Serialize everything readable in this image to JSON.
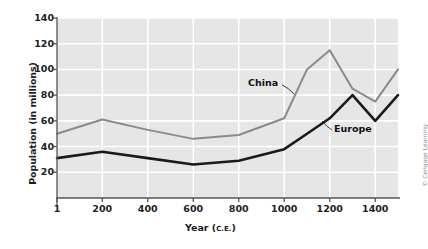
{
  "figure": {
    "credit": "© Cengage Learning"
  },
  "chart_data": {
    "type": "line",
    "title": "",
    "xlabel": "Year (C.E.)",
    "xlabel_main": "Year (",
    "xlabel_small": "C.E.",
    "xlabel_end": ")",
    "ylabel": "Population (in millions)",
    "xlim": [
      1,
      1500
    ],
    "ylim": [
      0,
      140
    ],
    "yticks": [
      140,
      120,
      100,
      80,
      60,
      40,
      20
    ],
    "xticks": [
      1,
      200,
      400,
      600,
      800,
      1000,
      1200,
      1400
    ],
    "xticklabels": [
      "1",
      "200",
      "400",
      "600",
      "800",
      "1000",
      "1200",
      "1400"
    ],
    "grid": true,
    "legend": "inline-labels",
    "colors": {
      "china": "#8a8a8a",
      "europe": "#1a1a1a",
      "plot_background": "#e6e6e6",
      "gridline": "#ffffff",
      "axis": "#555555"
    },
    "series": [
      {
        "name": "China",
        "color": "#8a8a8a",
        "x": [
          1,
          200,
          400,
          600,
          800,
          1000,
          1100,
          1200,
          1300,
          1400,
          1500
        ],
        "values": [
          50,
          61,
          53,
          46,
          49,
          62,
          100,
          115,
          85,
          75,
          100
        ]
      },
      {
        "name": "Europe",
        "color": "#1a1a1a",
        "x": [
          1,
          200,
          400,
          600,
          800,
          1000,
          1100,
          1200,
          1300,
          1400,
          1500
        ],
        "values": [
          31,
          36,
          31,
          26,
          29,
          38,
          50,
          62,
          80,
          60,
          80
        ]
      }
    ],
    "annotations": [
      {
        "name": "China",
        "label": "China"
      },
      {
        "name": "Europe",
        "label": "Europe"
      }
    ]
  }
}
